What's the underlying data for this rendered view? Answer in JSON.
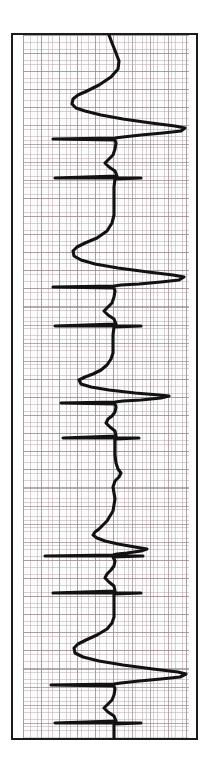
{
  "document": {
    "type": "ecg-rhythm-strip",
    "orientation": "vertical",
    "paper_color": "#fdfcfc",
    "grid_major_color": "#988c91",
    "grid_minor_color": "#b0a4aa",
    "frame_color": "#1b1b1b",
    "trace_color": "#121212"
  },
  "chart_data": {
    "type": "line",
    "title": "",
    "subtitle": "",
    "xlabel": "",
    "ylabel": "",
    "legend": [],
    "grid": true,
    "legend_position": "none",
    "axis_note": "Vertically printed ECG: time runs top-to-bottom, amplitude runs left-to-right. Baseline at x = 86 px within the grid region.",
    "baseline_x": 86,
    "xlim": [
      0,
      166
    ],
    "ylim": [
      0,
      703
    ],
    "grid_major_px": 18.1,
    "grid_minor_px": 3.62,
    "beat_count": 8,
    "beats": [
      {
        "index": 1,
        "r_peak_y": 92,
        "r_peak_x": 160,
        "q_trough_x": 62,
        "type": "qrs-complex"
      },
      {
        "index": 2,
        "r_peak_y": 187,
        "r_peak_x": 160,
        "q_trough_x": 60,
        "type": "qrs-complex"
      },
      {
        "index": 3,
        "r_peak_y": 283,
        "r_peak_x": 160,
        "q_trough_x": 58,
        "type": "qrs-complex"
      },
      {
        "index": 4,
        "r_peak_y": 362,
        "r_peak_x": 140,
        "q_trough_x": 86,
        "type": "low-amplitude-beat"
      },
      {
        "index": 5,
        "r_peak_y": 466,
        "r_peak_x": 126,
        "q_trough_x": 50,
        "type": "fusion-beat"
      },
      {
        "index": 6,
        "r_peak_y": 564,
        "r_peak_x": 160,
        "q_trough_x": 58,
        "type": "qrs-complex"
      },
      {
        "index": 7,
        "r_peak_y": 660,
        "r_peak_x": 162,
        "q_trough_x": 58,
        "type": "qrs-complex"
      },
      {
        "index": 8,
        "r_peak_y": 700,
        "r_peak_x": 96,
        "q_trough_x": 86,
        "type": "partial-beat"
      }
    ],
    "points": [
      [
        86,
        0
      ],
      [
        89,
        8
      ],
      [
        93,
        18
      ],
      [
        96,
        26
      ],
      [
        95,
        34
      ],
      [
        88,
        42
      ],
      [
        76,
        50
      ],
      [
        64,
        56
      ],
      [
        55,
        60
      ],
      [
        50,
        64
      ],
      [
        49,
        69
      ],
      [
        53,
        73
      ],
      [
        62,
        76
      ],
      [
        78,
        80
      ],
      [
        100,
        84
      ],
      [
        128,
        88
      ],
      [
        152,
        91
      ],
      [
        162,
        93
      ],
      [
        158,
        96
      ],
      [
        140,
        98
      ],
      [
        118,
        100
      ],
      [
        100,
        102
      ],
      [
        92,
        103
      ],
      [
        30,
        104
      ],
      [
        92,
        105
      ],
      [
        93,
        108
      ],
      [
        92,
        114
      ],
      [
        90,
        120
      ],
      [
        86,
        124
      ],
      [
        82,
        128
      ],
      [
        86,
        132
      ],
      [
        92,
        136
      ],
      [
        94,
        141
      ],
      [
        32,
        143
      ],
      [
        118,
        143
      ],
      [
        92,
        144
      ],
      [
        91,
        152
      ],
      [
        91,
        162
      ],
      [
        91,
        172
      ],
      [
        91,
        180
      ],
      [
        89,
        188
      ],
      [
        84,
        196
      ],
      [
        74,
        203
      ],
      [
        62,
        208
      ],
      [
        54,
        212
      ],
      [
        50,
        216
      ],
      [
        51,
        221
      ],
      [
        58,
        225
      ],
      [
        72,
        229
      ],
      [
        95,
        233
      ],
      [
        125,
        237
      ],
      [
        150,
        240
      ],
      [
        161,
        242
      ],
      [
        156,
        245
      ],
      [
        138,
        247
      ],
      [
        116,
        249
      ],
      [
        98,
        250
      ],
      [
        91,
        251
      ],
      [
        30,
        252
      ],
      [
        91,
        253
      ],
      [
        92,
        256
      ],
      [
        91,
        262
      ],
      [
        89,
        268
      ],
      [
        85,
        272
      ],
      [
        81,
        276
      ],
      [
        85,
        280
      ],
      [
        91,
        284
      ],
      [
        93,
        289
      ],
      [
        32,
        291
      ],
      [
        118,
        291
      ],
      [
        91,
        292
      ],
      [
        90,
        300
      ],
      [
        90,
        310
      ],
      [
        90,
        318
      ],
      [
        88,
        324
      ],
      [
        84,
        330
      ],
      [
        78,
        335
      ],
      [
        70,
        339
      ],
      [
        62,
        342
      ],
      [
        56,
        345
      ],
      [
        58,
        349
      ],
      [
        68,
        352
      ],
      [
        86,
        355
      ],
      [
        112,
        358
      ],
      [
        136,
        360
      ],
      [
        146,
        361
      ],
      [
        138,
        363
      ],
      [
        118,
        365
      ],
      [
        100,
        366
      ],
      [
        92,
        367
      ],
      [
        38,
        368
      ],
      [
        92,
        369
      ],
      [
        93,
        372
      ],
      [
        92,
        377
      ],
      [
        89,
        381
      ],
      [
        85,
        384
      ],
      [
        83,
        388
      ],
      [
        87,
        392
      ],
      [
        92,
        396
      ],
      [
        93,
        401
      ],
      [
        40,
        403
      ],
      [
        116,
        403
      ],
      [
        92,
        404
      ],
      [
        92,
        412
      ],
      [
        92,
        420
      ],
      [
        93,
        428
      ],
      [
        95,
        434
      ],
      [
        98,
        438
      ],
      [
        96,
        442
      ],
      [
        92,
        446
      ],
      [
        90,
        452
      ],
      [
        91,
        458
      ],
      [
        92,
        464
      ],
      [
        91,
        470
      ],
      [
        90,
        476
      ],
      [
        87,
        481
      ],
      [
        84,
        486
      ],
      [
        80,
        490
      ],
      [
        76,
        494
      ],
      [
        72,
        497
      ],
      [
        70,
        500
      ],
      [
        74,
        503
      ],
      [
        82,
        506
      ],
      [
        95,
        509
      ],
      [
        112,
        512
      ],
      [
        124,
        514
      ],
      [
        118,
        516
      ],
      [
        104,
        518
      ],
      [
        94,
        519
      ],
      [
        90,
        520
      ],
      [
        22,
        521
      ],
      [
        120,
        521
      ],
      [
        90,
        522
      ],
      [
        92,
        526
      ],
      [
        91,
        531
      ],
      [
        88,
        535
      ],
      [
        84,
        539
      ],
      [
        82,
        543
      ],
      [
        86,
        547
      ],
      [
        91,
        551
      ],
      [
        92,
        556
      ],
      [
        30,
        558
      ],
      [
        118,
        558
      ],
      [
        91,
        559
      ],
      [
        91,
        566
      ],
      [
        91,
        574
      ],
      [
        91,
        582
      ],
      [
        89,
        588
      ],
      [
        84,
        594
      ],
      [
        74,
        600
      ],
      [
        63,
        605
      ],
      [
        55,
        609
      ],
      [
        51,
        613
      ],
      [
        52,
        618
      ],
      [
        60,
        622
      ],
      [
        76,
        626
      ],
      [
        100,
        630
      ],
      [
        130,
        634
      ],
      [
        155,
        637
      ],
      [
        163,
        639
      ],
      [
        157,
        642
      ],
      [
        138,
        644
      ],
      [
        116,
        646
      ],
      [
        98,
        648
      ],
      [
        91,
        649
      ],
      [
        28,
        650
      ],
      [
        91,
        651
      ],
      [
        92,
        654
      ],
      [
        91,
        660
      ],
      [
        89,
        665
      ],
      [
        85,
        669
      ],
      [
        81,
        673
      ],
      [
        85,
        677
      ],
      [
        91,
        681
      ],
      [
        93,
        686
      ],
      [
        32,
        688
      ],
      [
        118,
        688
      ],
      [
        91,
        689
      ],
      [
        91,
        695
      ],
      [
        91,
        703
      ]
    ]
  }
}
